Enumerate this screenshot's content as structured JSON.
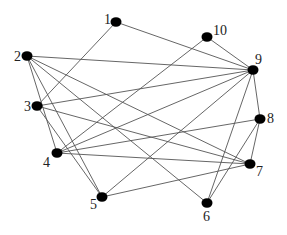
{
  "diagram": {
    "type": "undirected-graph",
    "colors": {
      "node": "#000000",
      "edge": "#555555",
      "label": "#222222",
      "background": "#ffffff"
    },
    "nodes": [
      {
        "id": "1",
        "label": "1",
        "x": 116,
        "y": 22,
        "lx": 104,
        "ly": 24,
        "anchor": "start"
      },
      {
        "id": "2",
        "label": "2",
        "x": 27,
        "y": 56,
        "lx": 14,
        "ly": 61,
        "anchor": "start"
      },
      {
        "id": "3",
        "label": "3",
        "x": 37,
        "y": 106,
        "lx": 24,
        "ly": 111,
        "anchor": "start"
      },
      {
        "id": "4",
        "label": "4",
        "x": 57,
        "y": 153,
        "lx": 43,
        "ly": 167,
        "anchor": "start"
      },
      {
        "id": "5",
        "label": "5",
        "x": 102,
        "y": 197,
        "lx": 90,
        "ly": 209,
        "anchor": "start"
      },
      {
        "id": "6",
        "label": "6",
        "x": 207,
        "y": 203,
        "lx": 203,
        "ly": 221,
        "anchor": "start"
      },
      {
        "id": "7",
        "label": "7",
        "x": 250,
        "y": 164,
        "lx": 256,
        "ly": 176,
        "anchor": "start"
      },
      {
        "id": "8",
        "label": "8",
        "x": 260,
        "y": 119,
        "lx": 267,
        "ly": 123,
        "anchor": "start"
      },
      {
        "id": "9",
        "label": "9",
        "x": 253,
        "y": 70,
        "lx": 255,
        "ly": 64,
        "anchor": "start"
      },
      {
        "id": "10",
        "label": "10",
        "x": 207,
        "y": 37,
        "lx": 213,
        "ly": 35,
        "anchor": "start"
      }
    ],
    "edges": [
      [
        "1",
        "9"
      ],
      [
        "1",
        "3"
      ],
      [
        "2",
        "9"
      ],
      [
        "2",
        "7"
      ],
      [
        "2",
        "6"
      ],
      [
        "2",
        "4"
      ],
      [
        "2",
        "5"
      ],
      [
        "3",
        "9"
      ],
      [
        "3",
        "7"
      ],
      [
        "3",
        "5"
      ],
      [
        "4",
        "10"
      ],
      [
        "4",
        "9"
      ],
      [
        "4",
        "8"
      ],
      [
        "4",
        "7"
      ],
      [
        "5",
        "9"
      ],
      [
        "5",
        "7"
      ],
      [
        "6",
        "9"
      ],
      [
        "6",
        "8"
      ],
      [
        "7",
        "8"
      ],
      [
        "8",
        "9"
      ],
      [
        "9",
        "10"
      ]
    ]
  }
}
